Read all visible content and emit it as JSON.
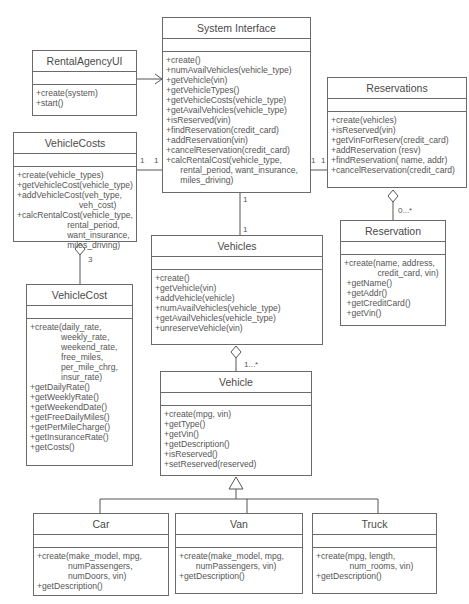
{
  "classes": {
    "rental_agency_ui": {
      "name": "RentalAgencyUI",
      "ops": [
        "+create(system)",
        "+start()"
      ]
    },
    "system_interface": {
      "name": "System Interface",
      "ops": [
        "+create()",
        "+numAvailVehicles(vehicle_type)",
        "+getVehicle(vin)",
        "+getVehicleTypes()",
        "+getVehicleCosts(vehicle_type)",
        "+getAvailVehicles(vehicle_type)",
        "+isReserved(vin)",
        "+findReservation(credit_card)",
        "+addReservation(vin)",
        "+cancelReservation(credit_card)",
        "+calcRentalCost(vehicle_type,",
        "      rental_period, want_insurance,",
        "      miles_driving)"
      ]
    },
    "reservations": {
      "name": "Reservations",
      "ops": [
        "+create(vehicles)",
        "+isReserved(vin)",
        "+getVinForReserv(credit_card)",
        "+addReservation (resv)",
        "+findReservation( name, addr)",
        "+cancelReservation(credit_card)"
      ]
    },
    "reservation": {
      "name": "Reservation",
      "ops": [
        "+create(name, address,",
        "              credit_card, vin)",
        " +getName()",
        " +getAddr()",
        " +getCreditCard()",
        " +getVin()"
      ]
    },
    "vehicle_costs": {
      "name": "VehicleCosts",
      "ops": [
        "+create(vehicle_types)",
        "+getVehicleCost(vehicle_type)",
        "+addVehicleCost(veh_type,",
        "                          veh_cost)",
        "+calcRentalCost(vehicle_type,",
        "                     rental_period,",
        "                     want_insurance,",
        "                     miles_driving)"
      ]
    },
    "vehicle_cost": {
      "name": "VehicleCost",
      "ops": [
        "+create(daily_rate,",
        "             weekly_rate,",
        "             weekend_rate,",
        "             free_miles,",
        "             per_mile_chrg,",
        "             insur_rate)",
        "+getDailyRate()",
        "+getWeeklyRate()",
        "+getWeekendDate()",
        "+getFreeDailyMiles()",
        "+getPerMileCharge()",
        "+getInsuranceRate()",
        "+getCosts()"
      ]
    },
    "vehicles": {
      "name": "Vehicles",
      "ops": [
        "+create()",
        "+getVehicle(vin)",
        "+addVehicle(vehicle)",
        "+numAvailVehicles(vehicle_type)",
        "+getAvailVehicles(vehicle_type)",
        "+unreserveVehicle(vin)"
      ]
    },
    "vehicle": {
      "name": "Vehicle",
      "ops": [
        "+create(mpg, vin)",
        "+getType()",
        "+getVin()",
        "+getDescription()",
        "+isReserved()",
        "+setReserved(reserved)"
      ]
    },
    "car": {
      "name": "Car",
      "ops": [
        "+create(make_model, mpg,",
        "             numPassengers,",
        "             numDoors, vin)",
        "+getDescription()"
      ]
    },
    "van": {
      "name": "Van",
      "ops": [
        "+create(make_model, mpg,",
        "       numPassengers, vin)",
        "+getDescription()"
      ]
    },
    "truck": {
      "name": "Truck",
      "ops": [
        "+create(mpg, length,",
        "              num_rooms, vin)",
        "+getDescription()"
      ]
    }
  },
  "multiplicities": {
    "costs_left": "1",
    "costs_right": "1",
    "resv_left": "1",
    "resv_right": "1",
    "si_vehicles_top": "1",
    "si_vehicles_bottom": "1",
    "vehicle_cost_agg": "3",
    "reservation_agg": "0...*",
    "vehicle_agg": "1...*"
  }
}
